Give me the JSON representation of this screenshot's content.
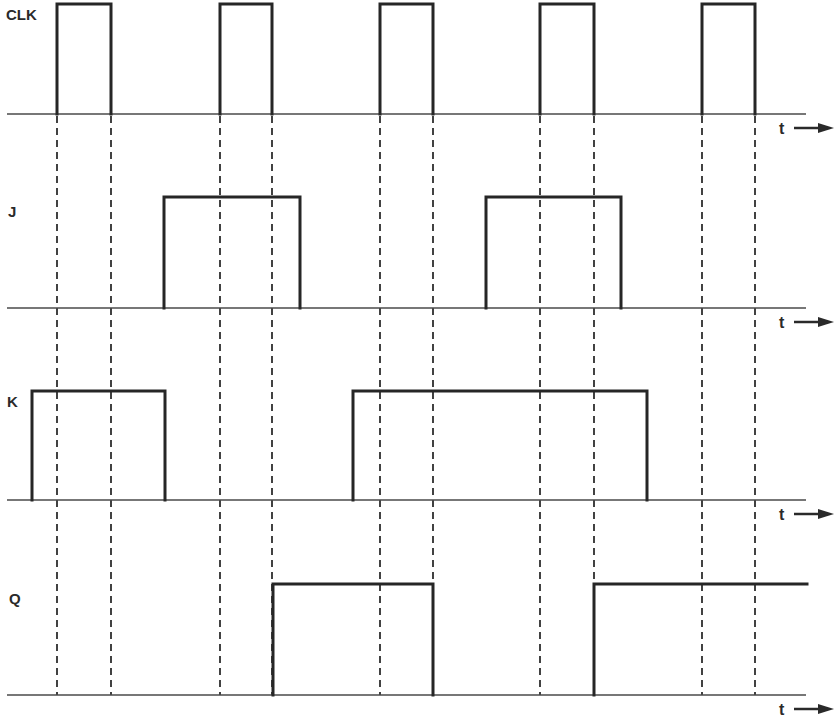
{
  "diagram": {
    "time_axis_label": "t",
    "colors": {
      "stroke": "#262626",
      "baseline": "#4a4a4a",
      "background": "#ffffff"
    },
    "signals": [
      {
        "name": "CLK",
        "baseline_y": 114,
        "high_y": 4,
        "label_x": 6,
        "label_y": 20,
        "high_intervals": [
          [
            57,
            111
          ],
          [
            220,
            272
          ],
          [
            380,
            433
          ],
          [
            540,
            594
          ],
          [
            702,
            755
          ]
        ]
      },
      {
        "name": "J",
        "baseline_y": 308,
        "high_y": 197,
        "label_x": 8,
        "label_y": 217,
        "high_intervals": [
          [
            164,
            300
          ],
          [
            486,
            621
          ]
        ]
      },
      {
        "name": "K",
        "baseline_y": 500,
        "high_y": 391,
        "label_x": 7,
        "label_y": 407,
        "high_intervals": [
          [
            32,
            165
          ],
          [
            353,
            647
          ]
        ]
      },
      {
        "name": "Q",
        "baseline_y": 695,
        "high_y": 584,
        "label_x": 9,
        "label_y": 604,
        "high_intervals": [
          [
            273,
            433
          ],
          [
            594,
            807
          ]
        ]
      }
    ],
    "clock_edge_guides_x": [
      57,
      111,
      220,
      272,
      380,
      433,
      540,
      594,
      702,
      755
    ],
    "guide_y_range": [
      114,
      695
    ],
    "baseline_x_range": [
      7,
      806
    ]
  }
}
